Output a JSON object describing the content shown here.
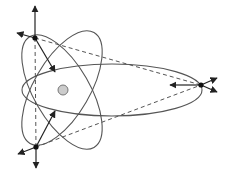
{
  "diagram": {
    "type": "orbital-diagram",
    "description": "Atom-like diagram: central nucleus with three elliptical orbits; three marked points with force/velocity arrows; dashed lines connecting the points",
    "colors": {
      "stroke": "#555555",
      "arrow": "#222222",
      "nucleus_fill": "#cccccc",
      "nucleus_stroke": "#777777",
      "background": "#ffffff"
    },
    "nucleus": {
      "cx": 63,
      "cy": 90,
      "r": 5
    },
    "orbits": [
      {
        "name": "horizontal-orbit",
        "cx": 112,
        "cy": 90,
        "rx": 90,
        "ry": 26,
        "rotate": 0
      },
      {
        "name": "tilted-orbit-right",
        "cx": 62,
        "cy": 88,
        "rx": 28,
        "ry": 64,
        "rotate": 30
      },
      {
        "name": "tilted-orbit-left",
        "cx": 62,
        "cy": 92,
        "rx": 28,
        "ry": 64,
        "rotate": -30
      }
    ],
    "points": [
      {
        "name": "top-left-point",
        "x": 35,
        "y": 38
      },
      {
        "name": "bottom-left-point",
        "x": 36,
        "y": 147
      },
      {
        "name": "right-point",
        "x": 201,
        "y": 85
      }
    ],
    "arrows": [
      {
        "name": "top-up-arrow",
        "x1": 35,
        "y1": 38,
        "x2": 35,
        "y2": 6
      },
      {
        "name": "top-left-arrow",
        "x1": 35,
        "y1": 38,
        "x2": 17,
        "y2": 33
      },
      {
        "name": "top-inward-arrow",
        "x1": 35,
        "y1": 38,
        "x2": 55,
        "y2": 72
      },
      {
        "name": "bottom-down-arrow",
        "x1": 36,
        "y1": 147,
        "x2": 36,
        "y2": 168
      },
      {
        "name": "bottom-left-arrow",
        "x1": 36,
        "y1": 147,
        "x2": 18,
        "y2": 154
      },
      {
        "name": "bottom-inward-arrow",
        "x1": 36,
        "y1": 147,
        "x2": 55,
        "y2": 111
      },
      {
        "name": "right-inward-arrow",
        "x1": 201,
        "y1": 85,
        "x2": 170,
        "y2": 85
      },
      {
        "name": "right-up-arrow",
        "x1": 201,
        "y1": 85,
        "x2": 217,
        "y2": 78
      },
      {
        "name": "right-down-arrow",
        "x1": 201,
        "y1": 85,
        "x2": 217,
        "y2": 92
      }
    ],
    "dashed_lines": [
      {
        "name": "top-to-right-dashed",
        "x1": 35,
        "y1": 38,
        "x2": 201,
        "y2": 85
      },
      {
        "name": "bottom-to-right-dashed",
        "x1": 36,
        "y1": 147,
        "x2": 201,
        "y2": 85
      },
      {
        "name": "top-to-bottom-dashed",
        "x1": 35,
        "y1": 38,
        "x2": 36,
        "y2": 147
      }
    ]
  }
}
